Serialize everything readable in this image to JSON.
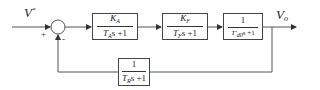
{
  "diagram": {
    "type": "block-diagram",
    "input": {
      "symbol": "V",
      "superscript": "*"
    },
    "output": {
      "symbol": "V",
      "subscript": "o"
    },
    "summing_junction": {
      "plus_sign": "+",
      "minus_sign": "-"
    },
    "forward_blocks": [
      {
        "id": "amplifier",
        "numerator": "K",
        "numerator_sub": "A",
        "den_T": "T",
        "den_T_sub": "A",
        "den_rest": "s +1"
      },
      {
        "id": "exciter",
        "numerator": "K",
        "numerator_sub": "F",
        "den_T": "T",
        "den_T_sub": "F",
        "den_rest": "s +1"
      },
      {
        "id": "generator",
        "numerator": "1",
        "den_T": "T'",
        "den_T_sub": "d0",
        "den_rest": "s +1"
      }
    ],
    "feedback_block": {
      "id": "sensor",
      "numerator": "1",
      "den_T": "T",
      "den_T_sub": "R",
      "den_rest": "s +1"
    },
    "colors": {
      "line": "#555555",
      "box_border": "#444444",
      "text": "#222222",
      "background": "#ffffff"
    }
  }
}
